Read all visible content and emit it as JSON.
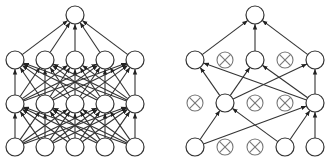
{
  "diagram": {
    "type": "neural-network-dropout-comparison",
    "colors": {
      "stroke": "#333333",
      "node_fill": "#ffffff",
      "dropped_stroke": "#777777",
      "background": "#ffffff"
    },
    "node_radius": 9,
    "panels": [
      {
        "name": "standard-network",
        "layers": [
          {
            "name": "input",
            "y": 147,
            "nodes": [
              {
                "x": 15,
                "active": true
              },
              {
                "x": 45,
                "active": true
              },
              {
                "x": 75,
                "active": true
              },
              {
                "x": 105,
                "active": true
              },
              {
                "x": 135,
                "active": true
              }
            ]
          },
          {
            "name": "hidden1",
            "y": 104,
            "nodes": [
              {
                "x": 15,
                "active": true
              },
              {
                "x": 45,
                "active": true
              },
              {
                "x": 75,
                "active": true
              },
              {
                "x": 105,
                "active": true
              },
              {
                "x": 135,
                "active": true
              }
            ]
          },
          {
            "name": "hidden2",
            "y": 60,
            "nodes": [
              {
                "x": 15,
                "active": true
              },
              {
                "x": 45,
                "active": true
              },
              {
                "x": 75,
                "active": true
              },
              {
                "x": 105,
                "active": true
              },
              {
                "x": 135,
                "active": true
              }
            ]
          },
          {
            "name": "output",
            "y": 15,
            "nodes": [
              {
                "x": 75,
                "active": true
              }
            ]
          }
        ],
        "edges": "fully-connected"
      },
      {
        "name": "dropout-network",
        "layers": [
          {
            "name": "input",
            "y": 147,
            "nodes": [
              {
                "x": 195,
                "active": true
              },
              {
                "x": 225,
                "active": false
              },
              {
                "x": 255,
                "active": false
              },
              {
                "x": 285,
                "active": true
              },
              {
                "x": 315,
                "active": true
              }
            ]
          },
          {
            "name": "hidden1",
            "y": 103,
            "nodes": [
              {
                "x": 195,
                "active": false
              },
              {
                "x": 225,
                "active": true
              },
              {
                "x": 255,
                "active": false
              },
              {
                "x": 285,
                "active": false
              },
              {
                "x": 315,
                "active": true
              }
            ]
          },
          {
            "name": "hidden2",
            "y": 60,
            "nodes": [
              {
                "x": 195,
                "active": true
              },
              {
                "x": 225,
                "active": false
              },
              {
                "x": 255,
                "active": true
              },
              {
                "x": 285,
                "active": false
              },
              {
                "x": 315,
                "active": true
              }
            ]
          },
          {
            "name": "output",
            "y": 15,
            "nodes": [
              {
                "x": 255,
                "active": true
              }
            ]
          }
        ],
        "edges": [
          [
            [
              0,
              0
            ],
            [
              1,
              1
            ]
          ],
          [
            [
              0,
              0
            ],
            [
              1,
              4
            ]
          ],
          [
            [
              0,
              3
            ],
            [
              1,
              1
            ]
          ],
          [
            [
              0,
              3
            ],
            [
              1,
              4
            ]
          ],
          [
            [
              0,
              4
            ],
            [
              1,
              4
            ]
          ],
          [
            [
              1,
              1
            ],
            [
              2,
              0
            ]
          ],
          [
            [
              1,
              1
            ],
            [
              2,
              2
            ]
          ],
          [
            [
              1,
              1
            ],
            [
              2,
              4
            ]
          ],
          [
            [
              1,
              4
            ],
            [
              2,
              0
            ]
          ],
          [
            [
              1,
              4
            ],
            [
              2,
              2
            ]
          ],
          [
            [
              1,
              4
            ],
            [
              2,
              4
            ]
          ],
          [
            [
              2,
              0
            ],
            [
              3,
              0
            ]
          ],
          [
            [
              2,
              2
            ],
            [
              3,
              0
            ]
          ],
          [
            [
              2,
              4
            ],
            [
              3,
              0
            ]
          ]
        ]
      }
    ]
  }
}
